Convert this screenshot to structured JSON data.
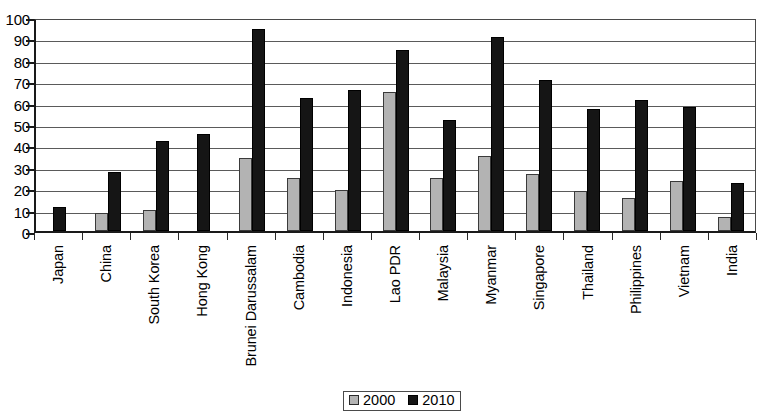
{
  "chart_data": {
    "type": "bar",
    "title": "",
    "subtitle": "",
    "xlabel": "",
    "ylabel": "",
    "ylim": [
      0,
      100
    ],
    "ytick_step": 10,
    "yticks": [
      0,
      10,
      20,
      30,
      40,
      50,
      60,
      70,
      80,
      90,
      100
    ],
    "grid": true,
    "legend_position": "bottom-center",
    "categories": [
      "Japan",
      "China",
      "South Korea",
      "Hong Kong",
      "Brunei Darussalam",
      "Cambodia",
      "Indonesia",
      "Lao PDR",
      "Malaysia",
      "Myanmar",
      "Singapore",
      "Thailand",
      "Philippines",
      "Vietnam",
      "India"
    ],
    "series": [
      {
        "name": "2000",
        "color": "#b3b3b3",
        "values": [
          0,
          8.5,
          10,
          0,
          34,
          25,
          19,
          65,
          25,
          35,
          26.5,
          18.5,
          15.5,
          23.5,
          6.5
        ]
      },
      {
        "name": "2010",
        "color": "#151515",
        "values": [
          11,
          27.5,
          42,
          45.5,
          94.5,
          62,
          66,
          84.5,
          52,
          90.5,
          70.5,
          57,
          61,
          58,
          22.5
        ]
      }
    ]
  },
  "legend": {
    "items": [
      {
        "label": "2000",
        "swatch": "gray-swatch"
      },
      {
        "label": "2010",
        "swatch": "black-swatch"
      }
    ]
  }
}
